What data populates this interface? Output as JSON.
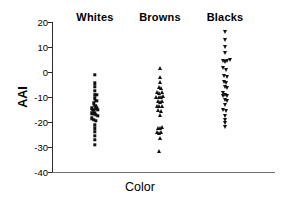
{
  "chart_data": {
    "type": "scatter",
    "title": "",
    "xlabel": "Color",
    "ylabel": "AAI",
    "ylim": [
      -40,
      20
    ],
    "yticks": [
      20,
      10,
      0,
      -10,
      -20,
      -30,
      -40
    ],
    "ytick_labels": [
      "20",
      "10",
      "0",
      "-10",
      "-20",
      "-30",
      "-40"
    ],
    "grid": false,
    "legend": "none",
    "categories": [
      "Whites",
      "Browns",
      "Blacks"
    ],
    "series": [
      {
        "name": "Whites",
        "marker": "square",
        "color": "#111111",
        "x_center": 95,
        "points": [
          {
            "offset": 0.0,
            "value": -1.0
          },
          {
            "offset": 0.0,
            "value": -4.5
          },
          {
            "offset": 0.0,
            "value": -6.0
          },
          {
            "offset": 0.0,
            "value": -7.5
          },
          {
            "offset": 0.0,
            "value": -9.0
          },
          {
            "offset": 1.3,
            "value": -9.0
          },
          {
            "offset": 0.0,
            "value": -10.5
          },
          {
            "offset": 1.4,
            "value": -11.5
          },
          {
            "offset": -1.4,
            "value": -12.5
          },
          {
            "offset": 0.2,
            "value": -13.5
          },
          {
            "offset": -3.2,
            "value": -14.5
          },
          {
            "offset": -1.6,
            "value": -15.0
          },
          {
            "offset": 1.2,
            "value": -14.5
          },
          {
            "offset": 2.6,
            "value": -15.0
          },
          {
            "offset": -2.6,
            "value": -16.5
          },
          {
            "offset": -0.8,
            "value": -16.5
          },
          {
            "offset": 1.0,
            "value": -17.0
          },
          {
            "offset": 2.8,
            "value": -17.5
          },
          {
            "offset": -3.0,
            "value": -18.5
          },
          {
            "offset": -1.2,
            "value": -19.0
          },
          {
            "offset": 0.6,
            "value": -19.5
          },
          {
            "offset": 0.0,
            "value": -21.0
          },
          {
            "offset": 0.0,
            "value": -22.5
          },
          {
            "offset": 0.0,
            "value": -24.0
          },
          {
            "offset": 0.0,
            "value": -25.5
          },
          {
            "offset": 0.0,
            "value": -27.0
          },
          {
            "offset": 0.0,
            "value": -29.0
          }
        ]
      },
      {
        "name": "Browns",
        "marker": "triangle-up",
        "color": "#111111",
        "x_center": 160,
        "points": [
          {
            "offset": 0.0,
            "value": 1.5
          },
          {
            "offset": 0.0,
            "value": -2.0
          },
          {
            "offset": 0.0,
            "value": -4.0
          },
          {
            "offset": -1.4,
            "value": -6.0
          },
          {
            "offset": 0.8,
            "value": -6.5
          },
          {
            "offset": -2.8,
            "value": -8.0
          },
          {
            "offset": -0.6,
            "value": -8.5
          },
          {
            "offset": 1.8,
            "value": -8.0
          },
          {
            "offset": -3.6,
            "value": -10.0
          },
          {
            "offset": -1.2,
            "value": -10.0
          },
          {
            "offset": 0.8,
            "value": -10.0
          },
          {
            "offset": 3.0,
            "value": -9.5
          },
          {
            "offset": -2.0,
            "value": -11.5
          },
          {
            "offset": 0.4,
            "value": -12.0
          },
          {
            "offset": 2.4,
            "value": -11.5
          },
          {
            "offset": -3.0,
            "value": -13.5
          },
          {
            "offset": -0.6,
            "value": -13.5
          },
          {
            "offset": 1.6,
            "value": -13.5
          },
          {
            "offset": -1.6,
            "value": -15.0
          },
          {
            "offset": 0.8,
            "value": -15.5
          },
          {
            "offset": -0.4,
            "value": -17.0
          },
          {
            "offset": -2.4,
            "value": -22.5
          },
          {
            "offset": -0.2,
            "value": -22.5
          },
          {
            "offset": 2.0,
            "value": -22.0
          },
          {
            "offset": -3.0,
            "value": -24.0
          },
          {
            "offset": -1.0,
            "value": -24.5
          },
          {
            "offset": 1.2,
            "value": -24.0
          },
          {
            "offset": -0.4,
            "value": -26.5
          },
          {
            "offset": -0.6,
            "value": -31.5
          }
        ]
      },
      {
        "name": "Blacks",
        "marker": "triangle-down",
        "color": "#111111",
        "x_center": 225,
        "points": [
          {
            "offset": 0.0,
            "value": 16.0
          },
          {
            "offset": 0.0,
            "value": 13.0
          },
          {
            "offset": 0.0,
            "value": 10.0
          },
          {
            "offset": 0.0,
            "value": 7.5
          },
          {
            "offset": -2.2,
            "value": 4.5
          },
          {
            "offset": 0.4,
            "value": 4.0
          },
          {
            "offset": 2.2,
            "value": 4.5
          },
          {
            "offset": 4.6,
            "value": 5.0
          },
          {
            "offset": -1.6,
            "value": 1.5
          },
          {
            "offset": 0.8,
            "value": 1.0
          },
          {
            "offset": -1.2,
            "value": -1.5
          },
          {
            "offset": 1.6,
            "value": -2.0
          },
          {
            "offset": -1.4,
            "value": -4.0
          },
          {
            "offset": 1.2,
            "value": -4.5
          },
          {
            "offset": 0.0,
            "value": -6.0
          },
          {
            "offset": 1.8,
            "value": -6.5
          },
          {
            "offset": -2.4,
            "value": -8.5
          },
          {
            "offset": -2.4,
            "value": -9.5
          },
          {
            "offset": 0.2,
            "value": -9.0
          },
          {
            "offset": 2.4,
            "value": -9.5
          },
          {
            "offset": -0.4,
            "value": -11.0
          },
          {
            "offset": 2.0,
            "value": -11.5
          },
          {
            "offset": 0.0,
            "value": -13.0
          },
          {
            "offset": -1.8,
            "value": -15.0
          },
          {
            "offset": 0.6,
            "value": -15.5
          },
          {
            "offset": 0.0,
            "value": -17.5
          },
          {
            "offset": 0.0,
            "value": -19.0
          },
          {
            "offset": 0.0,
            "value": -20.5
          },
          {
            "offset": 0.0,
            "value": -22.0
          }
        ]
      }
    ]
  }
}
